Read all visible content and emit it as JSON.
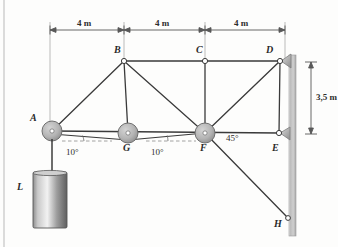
{
  "figure": {
    "background_color": "#fdfdfc",
    "line_color": "#3a3a3a",
    "pulley_fill": "#b9b9b9",
    "wall_color": "#b5b5b5",
    "load_color": "#9a9a9a"
  },
  "joint_labels": [
    {
      "name": "A",
      "text": "A",
      "x": 30,
      "y": 118
    },
    {
      "name": "B",
      "text": "B",
      "x": 116,
      "y": 48
    },
    {
      "name": "C",
      "text": "C",
      "x": 198,
      "y": 48
    },
    {
      "name": "D",
      "text": "D",
      "x": 268,
      "y": 48
    },
    {
      "name": "E",
      "text": "E",
      "x": 274,
      "y": 148
    },
    {
      "name": "F",
      "text": "F",
      "x": 199,
      "y": 148
    },
    {
      "name": "G",
      "text": "G",
      "x": 121,
      "y": 148
    },
    {
      "name": "H",
      "text": "H",
      "x": 276,
      "y": 222
    },
    {
      "name": "L",
      "text": "L",
      "x": 18,
      "y": 184
    }
  ],
  "dimensions": {
    "horizontal": [
      {
        "name": "span-a-b",
        "label": "4 m",
        "from_x": 50,
        "to_x": 124,
        "y": 30,
        "label_x": 72,
        "label_y": 21
      },
      {
        "name": "span-b-c",
        "label": "4 m",
        "from_x": 124,
        "to_x": 205,
        "y": 30,
        "label_x": 150,
        "label_y": 21
      },
      {
        "name": "span-c-d",
        "label": "4 m",
        "from_x": 205,
        "to_x": 285,
        "y": 30,
        "label_x": 231,
        "label_y": 21
      }
    ],
    "vertical": [
      {
        "name": "wall-height",
        "label": "3,5 m",
        "x": 311,
        "from_y": 62,
        "to_y": 134,
        "label_x": 302,
        "label_y": 93
      }
    ]
  },
  "angles": [
    {
      "name": "angle-ag",
      "label": "10°",
      "x": 74,
      "y": 153
    },
    {
      "name": "angle-gf",
      "label": "10°",
      "x": 160,
      "y": 153
    },
    {
      "name": "angle-fh",
      "label": "45°",
      "x": 228,
      "y": 139
    }
  ],
  "nodes": {
    "A": {
      "x": 52,
      "y": 131
    },
    "B": {
      "x": 124,
      "y": 61
    },
    "C": {
      "x": 205,
      "y": 61
    },
    "D": {
      "x": 280,
      "y": 61
    },
    "E": {
      "x": 279,
      "y": 133
    },
    "F": {
      "x": 205,
      "y": 133
    },
    "G": {
      "x": 128,
      "y": 133
    },
    "H": {
      "x": 288,
      "y": 218
    }
  },
  "pulleys": [
    {
      "name": "pulley-a",
      "at": "A",
      "radius": 10
    },
    {
      "name": "pulley-g",
      "at": "G",
      "radius": 10
    },
    {
      "name": "pulley-f",
      "at": "F",
      "radius": 10
    }
  ],
  "pin_joints": [
    {
      "name": "pin-b",
      "at": "B",
      "radius": 2.6
    },
    {
      "name": "pin-c",
      "at": "C",
      "radius": 2.6
    },
    {
      "name": "pin-d",
      "at": "D",
      "radius": 2.6
    },
    {
      "name": "pin-e",
      "at": "E",
      "radius": 2.6
    },
    {
      "name": "pin-h",
      "at": "H",
      "radius": 2.4
    }
  ],
  "members": [
    {
      "name": "member-ab",
      "from": "A",
      "to": "B"
    },
    {
      "name": "member-bc",
      "from": "B",
      "to": "C"
    },
    {
      "name": "member-cd",
      "from": "C",
      "to": "D"
    },
    {
      "name": "member-bg",
      "from": "B",
      "to": "G"
    },
    {
      "name": "member-bf",
      "from": "B",
      "to": "F"
    },
    {
      "name": "member-cf",
      "from": "C",
      "to": "F"
    },
    {
      "name": "member-df",
      "from": "D",
      "to": "F"
    },
    {
      "name": "member-de",
      "from": "D",
      "to": "E"
    },
    {
      "name": "member-af",
      "from": "A",
      "to": "E"
    },
    {
      "name": "member-fh",
      "from": "F",
      "to": "H"
    }
  ],
  "cables": [
    {
      "name": "cable-a-g",
      "from": "A",
      "to": "G"
    },
    {
      "name": "cable-g-f",
      "from": "G",
      "to": "F"
    }
  ],
  "wall": {
    "name": "support-wall",
    "x": 289,
    "top": 55,
    "bottom": 236,
    "width": 7
  },
  "load": {
    "name": "hanging-load",
    "rope_from": {
      "x": 52,
      "y": 141
    },
    "rope_to": {
      "x": 52,
      "y": 172
    },
    "cylinder": {
      "x": 33,
      "y": 172,
      "width": 34,
      "height": 56
    }
  }
}
